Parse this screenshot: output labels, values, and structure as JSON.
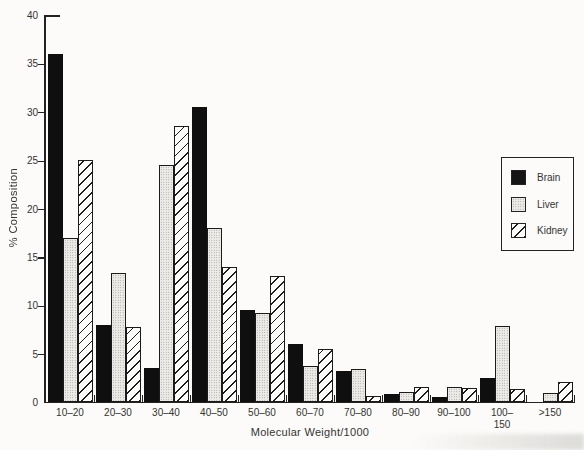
{
  "y_axis": {
    "label": "% Composition"
  },
  "x_axis": {
    "label": "Molecular Weight/1000"
  },
  "legend": {
    "items": [
      {
        "label": "Brain",
        "swatch": "solid-black"
      },
      {
        "label": "Liver",
        "swatch": "stipple-dots"
      },
      {
        "label": "Kidney",
        "swatch": "diagonal-hatch"
      }
    ]
  },
  "chart_data": {
    "type": "bar",
    "title": "",
    "xlabel": "Molecular Weight/1000",
    "ylabel": "% Composition",
    "ylim": [
      0,
      40
    ],
    "yticks": [
      0,
      5,
      10,
      15,
      20,
      25,
      30,
      35,
      40
    ],
    "grid": false,
    "legend_position": "right",
    "categories": [
      "10–20",
      "20–30",
      "30–40",
      "40–50",
      "50–60",
      "60–70",
      "70–80",
      "80–90",
      "90–100",
      "100–150",
      ">150"
    ],
    "categories_display": [
      [
        "10–20"
      ],
      [
        "20–30"
      ],
      [
        "30–40"
      ],
      [
        "40–50"
      ],
      [
        "50–60"
      ],
      [
        "60–70"
      ],
      [
        "70–80"
      ],
      [
        "80–90"
      ],
      [
        "90–100"
      ],
      [
        "100–",
        "150"
      ],
      [
        ">150"
      ]
    ],
    "series": [
      {
        "name": "Brain",
        "pattern": "solid-black",
        "values": [
          36,
          8,
          3.5,
          30.5,
          9.5,
          6,
          3.2,
          0.8,
          0.5,
          2.5,
          0
        ]
      },
      {
        "name": "Liver",
        "pattern": "stipple-dots",
        "values": [
          17,
          13.3,
          24.5,
          18,
          9.2,
          3.7,
          3.4,
          1.0,
          1.6,
          7.9,
          0.9
        ]
      },
      {
        "name": "Kidney",
        "pattern": "diagonal-hatch",
        "values": [
          25,
          7.8,
          28.5,
          14,
          13,
          5.5,
          0.6,
          1.5,
          1.4,
          1.3,
          2.1
        ]
      }
    ]
  }
}
